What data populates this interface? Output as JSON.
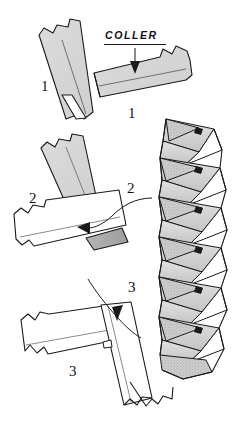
{
  "figure": {
    "title": "COLLER",
    "kind": "line-art instructional diagram",
    "background_color": "#ffffff",
    "ink_color": "#1a1a1a",
    "paper_fill_gray": "#d4d4d4",
    "paper_fill_white": "#ffffff",
    "shadow_gray": "#9a9a9a"
  },
  "annotations": {
    "coller_label": "COLLER",
    "step1_left": "1",
    "step1_right": "1",
    "step2_left": "2",
    "step2_right": "2",
    "step3_right": "3",
    "step3_left": "3"
  },
  "steps": [
    {
      "number": "1",
      "caption": "COLLER",
      "description": "Two paper strips with torn ends laid at right angles, glued where they overlap"
    },
    {
      "number": "2",
      "description": "Lower strip folded over the other, arrow shows fold direction to the left"
    },
    {
      "number": "3",
      "description": "Strip folded back across, arrow shows fold direction downward"
    }
  ],
  "result": {
    "description": "Finished woven accordion column of interlocking folded paper triangles"
  }
}
